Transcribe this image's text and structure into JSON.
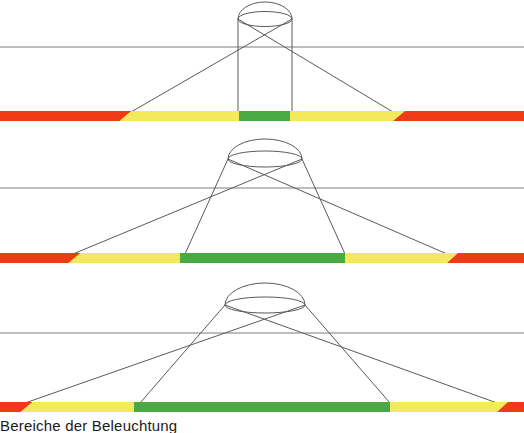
{
  "figure": {
    "title_caption": "Bereiche der Beleuchtung",
    "background": "#ffffff",
    "width": 524,
    "height": 433,
    "line_color": "#555555",
    "colors": {
      "red": "#ee3a17",
      "yellow": "#f2ea5a",
      "green": "#49a942",
      "outline": "#5a5a5a",
      "reference_line": "#7a7a7a"
    },
    "panels": [
      {
        "name": "panel-narrow-beam",
        "index": 1,
        "top": 0,
        "height": 140,
        "reference_line_y": 47,
        "bar": {
          "y": 111,
          "height": 10,
          "segments": [
            {
              "zone": "red",
              "x0": 0,
              "x1": 131,
              "color": "#ee3a17"
            },
            {
              "zone": "yellow",
              "x0": 131,
              "x1": 239,
              "color": "#f2ea5a"
            },
            {
              "zone": "green",
              "x0": 239,
              "x1": 290,
              "color": "#49a942"
            },
            {
              "zone": "yellow",
              "x0": 290,
              "x1": 393,
              "color": "#f2ea5a"
            },
            {
              "zone": "red",
              "x0": 393,
              "x1": 524,
              "color": "#ee3a17"
            }
          ]
        },
        "luminaire": {
          "shape": "cylinder",
          "cx": 265,
          "top_y": 11,
          "ellipse_rx": 27,
          "ellipse_ry": 8,
          "left_x": 238,
          "right_x": 292,
          "base_y": 112
        },
        "rays": [
          {
            "from_x": 238,
            "from_y": 19,
            "to_x": 393,
            "to_y": 112
          },
          {
            "from_x": 292,
            "from_y": 19,
            "to_x": 131,
            "to_y": 112
          }
        ]
      },
      {
        "name": "panel-medium-beam",
        "index": 2,
        "top": 140,
        "height": 140,
        "reference_line_y": 188,
        "bar": {
          "y": 253,
          "height": 10,
          "segments": [
            {
              "zone": "red",
              "x0": 0,
              "x1": 73,
              "color": "#ee3a17"
            },
            {
              "zone": "yellow",
              "x0": 73,
              "x1": 180,
              "color": "#f2ea5a"
            },
            {
              "zone": "green",
              "x0": 180,
              "x1": 345,
              "color": "#49a942"
            },
            {
              "zone": "yellow",
              "x0": 345,
              "x1": 447,
              "color": "#f2ea5a"
            },
            {
              "zone": "red",
              "x0": 447,
              "x1": 524,
              "color": "#ee3a17"
            }
          ]
        },
        "luminaire": {
          "shape": "ellipse",
          "cx": 265,
          "top_y": 150,
          "ellipse_rx": 37,
          "ellipse_ry": 9,
          "left_x": 228,
          "right_x": 302,
          "base_y": 254
        },
        "rays": [
          {
            "from_x": 228,
            "from_y": 159,
            "to_x": 447,
            "to_y": 254
          },
          {
            "from_x": 302,
            "from_y": 159,
            "to_x": 73,
            "to_y": 254
          }
        ]
      },
      {
        "name": "panel-wide-beam",
        "index": 3,
        "top": 285,
        "height": 130,
        "reference_line_y": 333,
        "bar": {
          "y": 402,
          "height": 10,
          "segments": [
            {
              "zone": "red",
              "x0": 0,
              "x1": 25,
              "color": "#ee3a17"
            },
            {
              "zone": "yellow",
              "x0": 25,
              "x1": 134,
              "color": "#f2ea5a"
            },
            {
              "zone": "green",
              "x0": 134,
              "x1": 390,
              "color": "#49a942"
            },
            {
              "zone": "yellow",
              "x0": 390,
              "x1": 497,
              "color": "#f2ea5a"
            },
            {
              "zone": "red",
              "x0": 497,
              "x1": 524,
              "color": "#ee3a17"
            }
          ]
        },
        "luminaire": {
          "shape": "ellipse",
          "cx": 265,
          "top_y": 295,
          "ellipse_rx": 40,
          "ellipse_ry": 10,
          "left_x": 225,
          "right_x": 305,
          "base_y": 403
        },
        "rays": [
          {
            "from_x": 225,
            "from_y": 305,
            "to_x": 497,
            "to_y": 403
          },
          {
            "from_x": 305,
            "from_y": 305,
            "to_x": 25,
            "to_y": 403
          }
        ]
      }
    ]
  }
}
